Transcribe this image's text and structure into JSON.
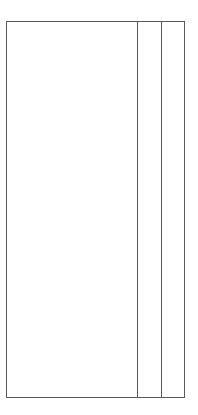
{
  "diagram": {
    "type": "wireframe",
    "frame": {
      "columns": [
        {
          "id": "main",
          "label": ""
        },
        {
          "id": "middle",
          "label": ""
        },
        {
          "id": "right",
          "label": ""
        }
      ]
    },
    "colors": {
      "stroke": "#5a5a5a",
      "background": "#ffffff"
    }
  }
}
